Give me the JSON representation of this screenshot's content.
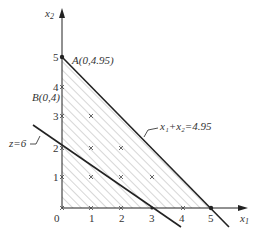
{
  "axes": {
    "x_label": "x",
    "x_sub": "1",
    "y_label": "x",
    "y_sub": "2",
    "origin_label": "0",
    "x_ticks": [
      "1",
      "2",
      "3",
      "4",
      "5"
    ],
    "y_ticks": [
      "1",
      "2",
      "3",
      "4",
      "5"
    ]
  },
  "points": {
    "A": "A(0,4.95)",
    "B": "B(0,4)"
  },
  "lines": {
    "constraint": "x₁+x₂=4.95",
    "objective": "z=6"
  },
  "colors": {
    "stroke": "#222222",
    "hatch": "#888888",
    "text": "#333333"
  }
}
